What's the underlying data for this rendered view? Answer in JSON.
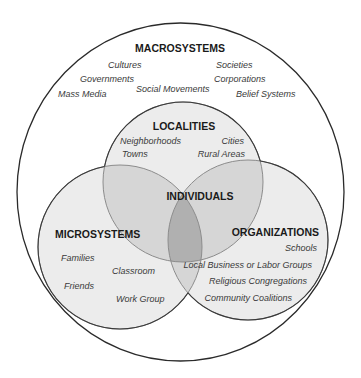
{
  "diagram": {
    "colors": {
      "background": "#ffffff",
      "outer_stroke": "#2a2a2a",
      "circle_fill": "#ececec",
      "inner_stroke_dark": "#3a3a3a",
      "inner_stroke_light": "#8c8c8c",
      "overlap_tint": "#000000"
    },
    "macrosystems": {
      "heading": "MACROSYSTEMS",
      "items": [
        "Cultures",
        "Governments",
        "Mass Media",
        "Social Movements",
        "Societies",
        "Corporations",
        "Belief Systems"
      ]
    },
    "localities": {
      "heading": "LOCALITIES",
      "items": [
        "Neighborhoods",
        "Cities",
        "Towns",
        "Rural Areas"
      ]
    },
    "individuals": {
      "heading": "INDIVIDUALS"
    },
    "microsystems": {
      "heading": "MICROSYSTEMS",
      "items": [
        "Families",
        "Classroom",
        "Friends",
        "Work Group"
      ]
    },
    "organizations": {
      "heading": "ORGANIZATIONS",
      "items": [
        "Schools",
        "Local Business or Labor Groups",
        "Religious Congregations",
        "Community Coalitions"
      ]
    }
  }
}
